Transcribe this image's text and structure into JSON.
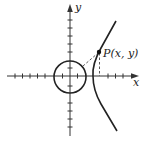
{
  "figure": {
    "type": "diagram",
    "axes": {
      "x_label": "x",
      "y_label": "y",
      "origin_px": [
        70,
        76
      ],
      "tick_spacing_px": 7.6
    },
    "circle": {
      "center_px": [
        70,
        78
      ],
      "radius_px": 16
    },
    "point": {
      "label": "P(x, y)",
      "position_px": [
        99,
        52
      ]
    },
    "colors": {
      "stroke": "#222222",
      "background": "#ffffff"
    }
  }
}
